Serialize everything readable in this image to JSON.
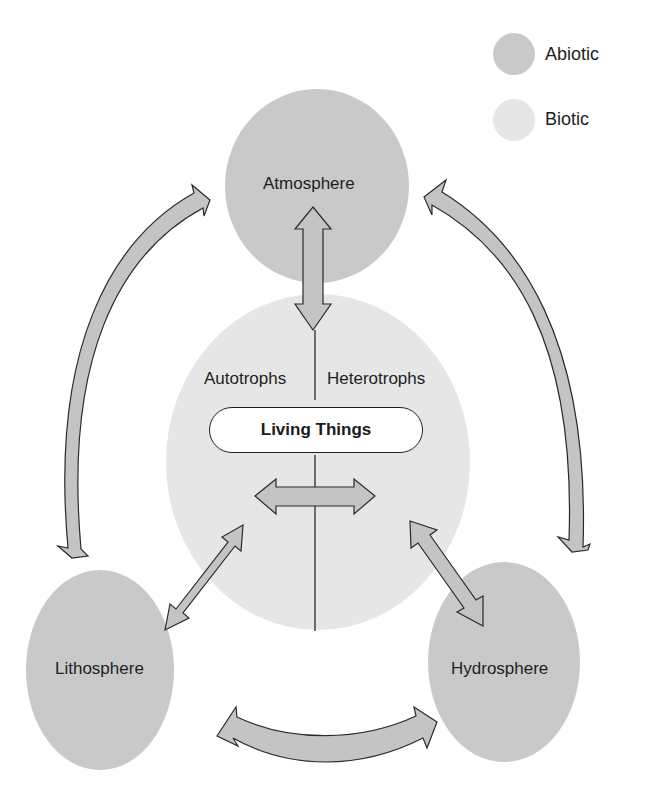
{
  "legend": {
    "items": [
      {
        "label": "Abiotic",
        "color": "#c9c9c9"
      },
      {
        "label": "Biotic",
        "color": "#e6e6e6"
      }
    ]
  },
  "nodes": {
    "atmosphere": {
      "label": "Atmosphere",
      "type": "Abiotic"
    },
    "lithosphere": {
      "label": "Lithosphere",
      "type": "Abiotic"
    },
    "hydrosphere": {
      "label": "Hydrosphere",
      "type": "Abiotic"
    },
    "biosphere": {
      "center_label": "Living Things",
      "left_label": "Autotrophs",
      "right_label": "Heterotrophs",
      "type": "Biotic"
    }
  },
  "connections": [
    {
      "from": "Atmosphere",
      "to": "Living Things",
      "direction": "bidirectional"
    },
    {
      "from": "Lithosphere",
      "to": "Living Things",
      "direction": "bidirectional"
    },
    {
      "from": "Hydrosphere",
      "to": "Living Things",
      "direction": "bidirectional"
    },
    {
      "from": "Autotrophs",
      "to": "Heterotrophs",
      "direction": "bidirectional"
    },
    {
      "from": "Atmosphere",
      "to": "Lithosphere",
      "direction": "bidirectional"
    },
    {
      "from": "Atmosphere",
      "to": "Hydrosphere",
      "direction": "bidirectional"
    },
    {
      "from": "Lithosphere",
      "to": "Hydrosphere",
      "direction": "bidirectional"
    }
  ],
  "colors": {
    "abiotic": "#c9c9c9",
    "biotic": "#e6e6e6",
    "arrow_fill": "#c4c4c4",
    "stroke": "#2a2a2a"
  }
}
